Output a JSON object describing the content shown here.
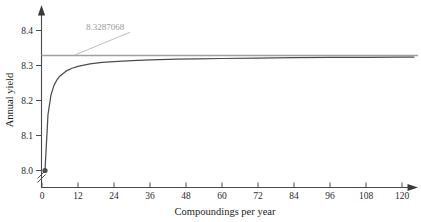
{
  "chart_data": {
    "type": "line",
    "title": "",
    "xlabel": "Compoundings per year",
    "ylabel": "Annual yield",
    "xlim": [
      0,
      124
    ],
    "ylim": [
      7.97,
      8.44
    ],
    "grid": false,
    "legend": "none",
    "y_axis_break": true,
    "x_ticks": [
      0,
      12,
      24,
      36,
      48,
      60,
      72,
      84,
      96,
      108,
      120
    ],
    "x_tick_labels": [
      "0",
      "12",
      "24",
      "36",
      "48",
      "60",
      "72",
      "84",
      "96",
      "108",
      "120"
    ],
    "y_ticks": [
      8.0,
      8.1,
      8.2,
      8.3,
      8.4
    ],
    "y_tick_labels": [
      "8.0",
      "8.1",
      "8.2",
      "8.3",
      "8.4"
    ],
    "series": [
      {
        "name": "Annual yield",
        "color": "#4c4c4c",
        "x": [
          1,
          2,
          3,
          4,
          5,
          6,
          8,
          10,
          12,
          16,
          20,
          24,
          30,
          36,
          45,
          52,
          60,
          72,
          84,
          96,
          108,
          120,
          124
        ],
        "values": [
          8.0,
          8.16,
          8.2161,
          8.2432,
          8.2595,
          8.2703,
          8.2839,
          8.2921,
          8.2976,
          8.3044,
          8.3086,
          8.3113,
          8.3141,
          8.3161,
          8.318,
          8.319,
          8.32,
          8.3213,
          8.3222,
          8.3229,
          8.3235,
          8.324,
          8.3241
        ]
      }
    ],
    "asymptote": {
      "name": "continuous-compounding-asymptote",
      "value": 8.3287068,
      "label": "8.3287068",
      "color": "#a0a0a0",
      "leader_from": [
        11,
        8.3287068
      ],
      "leader_to": [
        22,
        8.395
      ]
    },
    "markers": [
      {
        "name": "start-point",
        "x": 1,
        "y": 8.0,
        "color": "#4c4c4c"
      }
    ]
  },
  "axes": {
    "x_title": "Compoundings per year",
    "y_title": "Annual yield",
    "axis_color": "#4a4a4a"
  },
  "ticks": {
    "x": [
      {
        "label": "0"
      },
      {
        "label": "12"
      },
      {
        "label": "24"
      },
      {
        "label": "36"
      },
      {
        "label": "48"
      },
      {
        "label": "60"
      },
      {
        "label": "72"
      },
      {
        "label": "84"
      },
      {
        "label": "96"
      },
      {
        "label": "108"
      },
      {
        "label": "120"
      }
    ],
    "y": [
      {
        "label": "8.4"
      },
      {
        "label": "8.3"
      },
      {
        "label": "8.2"
      },
      {
        "label": "8.1"
      },
      {
        "label": "8.0"
      }
    ]
  },
  "annotation": {
    "asymptote_label": "8.3287068"
  }
}
